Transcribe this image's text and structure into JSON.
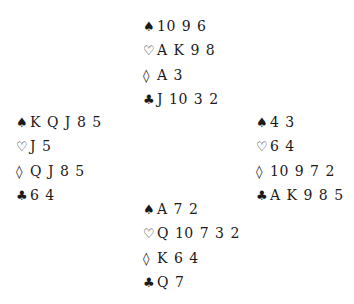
{
  "hands": {
    "north": {
      "spades": "10 9 6",
      "hearts": "A K 9 8",
      "diamonds": "A 3",
      "clubs": "J 10 3 2"
    },
    "west": {
      "spades": "K Q J 8 5",
      "hearts": "J 5",
      "diamonds": "Q J 8 5",
      "clubs": "6 4"
    },
    "east": {
      "spades": "4 3",
      "hearts": "6 4",
      "diamonds": "10 9 7 2",
      "clubs": "A K 9 8 5"
    },
    "south": {
      "spades": "A 7 2",
      "hearts": "Q 10 7 3 2",
      "diamonds": "K 6 4",
      "clubs": "Q 7"
    }
  },
  "suit_symbols": {
    "spades": "♠",
    "hearts": "♡",
    "diamonds": "◊",
    "clubs": "♣"
  }
}
